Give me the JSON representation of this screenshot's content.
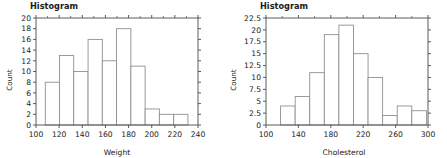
{
  "figure": {
    "background": "#ffffff",
    "bar_edge_color": "#8a8a8a",
    "bar_fill_color": "#ffffff",
    "axis_color": "#4a4a4a"
  },
  "panels": [
    {
      "id": "weight",
      "title": "Histogram",
      "ylabel": "Count",
      "xlabel": "Weight"
    },
    {
      "id": "cholesterol",
      "title": "Histogram",
      "ylabel": "Count",
      "xlabel": "Cholesterol"
    }
  ],
  "chart_data": [
    {
      "type": "bar",
      "title": "Histogram",
      "xlabel": "Weight",
      "ylabel": "Count",
      "xlim": [
        100,
        240
      ],
      "ylim": [
        0,
        20
      ],
      "xticks": [
        100,
        120,
        140,
        160,
        180,
        200,
        220,
        240
      ],
      "yticks": [
        0,
        2,
        4,
        6,
        8,
        10,
        12,
        14,
        16,
        18,
        20
      ],
      "grid": false,
      "legend": null,
      "bin_edges": [
        108.0,
        120.3,
        132.6,
        145.0,
        157.3,
        169.6,
        182.0,
        194.3,
        206.6,
        219.0,
        231.3
      ],
      "categories": [
        "108-120",
        "120-133",
        "133-145",
        "145-157",
        "157-170",
        "170-182",
        "182-194",
        "194-207",
        "207-219",
        "219-231"
      ],
      "values": [
        8,
        13,
        10,
        16,
        12,
        18,
        11,
        3,
        2,
        2
      ]
    },
    {
      "type": "bar",
      "title": "Histogram",
      "xlabel": "Cholesterol",
      "ylabel": "Count",
      "xlim": [
        100,
        300
      ],
      "ylim": [
        0,
        22.5
      ],
      "xticks": [
        100,
        140,
        180,
        220,
        260,
        300
      ],
      "yticks": [
        0,
        2.5,
        5,
        7.5,
        10,
        12.5,
        15,
        17.5,
        20,
        22.5
      ],
      "grid": false,
      "legend": null,
      "bin_edges": [
        118,
        136,
        154,
        172,
        190,
        208,
        226,
        244,
        262,
        280
      ],
      "categories": [
        "118-136",
        "136-154",
        "154-172",
        "172-190",
        "190-208",
        "208-226",
        "226-244",
        "244-262",
        "262-280",
        "280-298"
      ],
      "values": [
        4,
        6,
        11,
        19,
        21,
        15,
        10,
        2,
        4,
        3
      ]
    }
  ],
  "tick_labels": {
    "weight_x": [
      "100",
      "120",
      "140",
      "160",
      "180",
      "200",
      "220",
      "240"
    ],
    "weight_y": [
      "0",
      "2",
      "4",
      "6",
      "8",
      "10",
      "12",
      "14",
      "16",
      "18",
      "20"
    ],
    "chol_x": [
      "100",
      "140",
      "180",
      "220",
      "260",
      "300"
    ],
    "chol_y": [
      "0",
      "2.5",
      "5",
      "7.5",
      "10",
      "12.5",
      "15",
      "17.5",
      "20",
      "22.5"
    ]
  }
}
